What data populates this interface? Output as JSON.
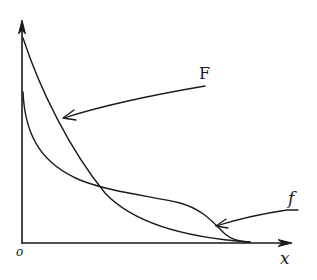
{
  "diagram": {
    "type": "function-curves-sketch",
    "axes": {
      "origin_label": "o",
      "x_label": "x",
      "y_label": ""
    },
    "curves": [
      {
        "name": "F",
        "label": "F",
        "description": "steeply decreasing convex curve from top of y-axis, approaching x-axis"
      },
      {
        "name": "f",
        "label": "f",
        "description": "starts lower on y-axis, drops quickly, has a shoulder/plateau, then falls to x-axis"
      }
    ],
    "annotations": [
      {
        "text": "F",
        "points_to": "F"
      },
      {
        "text": "f",
        "points_to": "f"
      }
    ],
    "colors": {
      "ink": "#1a1a1a",
      "background": "#ffffff"
    }
  }
}
